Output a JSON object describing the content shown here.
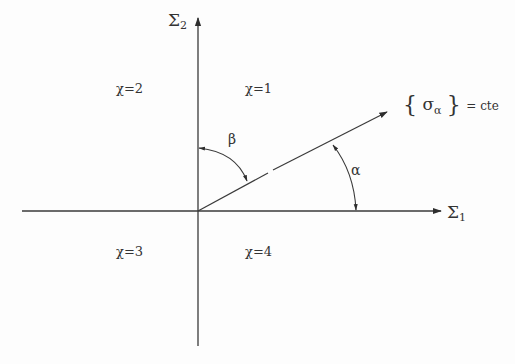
{
  "diagram": {
    "type": "coordinate-plane",
    "colors": {
      "line": "#3a3a3a",
      "text": "#333333",
      "background": "#fdfdfd"
    },
    "axes": {
      "horizontal": {
        "label_main": "Σ",
        "label_sub": "1"
      },
      "vertical": {
        "label_main": "Σ",
        "label_sub": "2"
      }
    },
    "quadrants": [
      {
        "id": 1,
        "label": "χ=1"
      },
      {
        "id": 2,
        "label": "χ=2"
      },
      {
        "id": 3,
        "label": "χ=3"
      },
      {
        "id": 4,
        "label": "χ=4"
      }
    ],
    "ray": {
      "label_open": "{",
      "label_sigma": "σ",
      "label_sub": "α",
      "label_close": "}",
      "label_eq": "= cte"
    },
    "angles": {
      "alpha": "α",
      "beta": "β"
    }
  }
}
